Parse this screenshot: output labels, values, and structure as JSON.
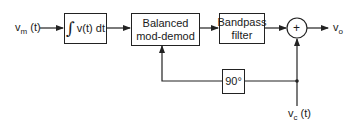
{
  "diagram": {
    "input": {
      "label_main": "v",
      "label_sub": "m",
      "label_suffix": " (t)"
    },
    "output": {
      "label_main": "v",
      "label_sub": "o"
    },
    "carrier": {
      "label_main": "v",
      "label_sub": "c",
      "label_suffix": " (t)"
    },
    "blocks": {
      "integrator": {
        "symbol": "∫",
        "text": "v(t) dt"
      },
      "mod_demod": {
        "line1": "Balanced",
        "line2": "mod-demod"
      },
      "bandpass": {
        "line1": "Bandpass",
        "line2": "filter"
      },
      "summer": {
        "symbol": "+"
      },
      "phase_shift": {
        "text": "90°"
      }
    },
    "colors": {
      "line": "#222222",
      "background": "#ffffff"
    }
  }
}
